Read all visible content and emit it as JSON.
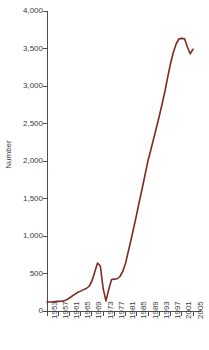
{
  "chart_data": {
    "type": "line",
    "title": "",
    "xlabel": "",
    "ylabel": "Number",
    "xlim": [
      1953,
      2005
    ],
    "ylim": [
      0,
      4000
    ],
    "grid": false,
    "legend": false,
    "line_color": "#7d2b22",
    "axis_color": "#4d4d4d",
    "ytick_labels": [
      "4,000",
      "3,500",
      "3,000",
      "2,500",
      "2,000",
      "1,500",
      "1,000",
      "500",
      "0"
    ],
    "ytick_values": [
      4000,
      3500,
      3000,
      2500,
      2000,
      1500,
      1000,
      500,
      0
    ],
    "xtick_labels": [
      "1953",
      "1957",
      "1961",
      "1965",
      "1969",
      "1973",
      "1977",
      "1981",
      "1985",
      "1989",
      "1993",
      "1997",
      "2001",
      "2005"
    ],
    "xtick_values": [
      1953,
      1957,
      1961,
      1965,
      1969,
      1973,
      1977,
      1981,
      1985,
      1989,
      1993,
      1997,
      2001,
      2005
    ],
    "x": [
      1953,
      1954,
      1955,
      1956,
      1957,
      1958,
      1959,
      1960,
      1961,
      1962,
      1963,
      1964,
      1965,
      1966,
      1967,
      1968,
      1969,
      1970,
      1971,
      1972,
      1973,
      1974,
      1975,
      1976,
      1977,
      1978,
      1979,
      1980,
      1981,
      1982,
      1983,
      1984,
      1985,
      1986,
      1987,
      1988,
      1989,
      1990,
      1991,
      1992,
      1993,
      1994,
      1995,
      1996,
      1997,
      1998,
      1999,
      2000,
      2001,
      2002,
      2003,
      2004,
      2005
    ],
    "values": [
      120,
      120,
      122,
      125,
      128,
      130,
      135,
      150,
      175,
      200,
      225,
      250,
      265,
      285,
      300,
      330,
      400,
      520,
      640,
      600,
      300,
      135,
      290,
      420,
      425,
      430,
      460,
      530,
      640,
      800,
      960,
      1130,
      1300,
      1480,
      1650,
      1830,
      2010,
      2150,
      2300,
      2450,
      2600,
      2760,
      2930,
      3120,
      3300,
      3450,
      3560,
      3630,
      3635,
      3630,
      3520,
      3430,
      3490
    ],
    "series": [
      {
        "name": "Number",
        "values": [
          120,
          120,
          122,
          125,
          128,
          130,
          135,
          150,
          175,
          200,
          225,
          250,
          265,
          285,
          300,
          330,
          400,
          520,
          640,
          600,
          300,
          135,
          290,
          420,
          425,
          430,
          460,
          530,
          640,
          800,
          960,
          1130,
          1300,
          1480,
          1650,
          1830,
          2010,
          2150,
          2300,
          2450,
          2600,
          2760,
          2930,
          3120,
          3300,
          3450,
          3560,
          3630,
          3635,
          3630,
          3520,
          3430,
          3490
        ]
      }
    ]
  }
}
